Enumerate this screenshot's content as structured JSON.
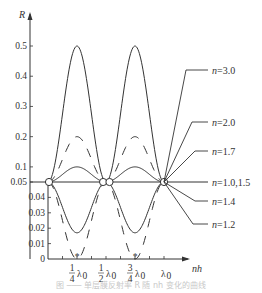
{
  "chart_data": {
    "type": "line",
    "title": "",
    "xlabel": "nh",
    "ylabel": "R",
    "x_unit": "λ0",
    "x_ticks": [
      {
        "value": 0.25,
        "label_num": "1",
        "label_den": "4",
        "label_suffix": "λ0",
        "marker": "*"
      },
      {
        "value": 0.5,
        "label_num": "1",
        "label_den": "2",
        "label_suffix": "λ0"
      },
      {
        "value": 0.75,
        "label_num": "3",
        "label_den": "4",
        "label_suffix": "λ0",
        "marker": "*"
      },
      {
        "value": 1.0,
        "label": "λ0"
      }
    ],
    "x_minor_ticks": [
      0.125,
      0.25,
      0.375,
      0.5,
      0.625,
      0.75,
      0.875,
      1.0
    ],
    "y_axis_break": 0.05,
    "y_ticks_upper": [
      "0.5",
      "0.4",
      "0.3",
      "0.2",
      "0.1",
      "0.05"
    ],
    "y_ticks_lower": [
      "0.04",
      "0.03",
      "0.02",
      "0.01",
      "0"
    ],
    "ylim": [
      0,
      0.55
    ],
    "xlim": [
      0,
      1.1
    ],
    "grid": false,
    "legend_position": "right, leader-line labels",
    "series": [
      {
        "name": "n=3.0",
        "style": "solid",
        "peak_R": 0.5,
        "x": [
          0,
          0.125,
          0.25,
          0.375,
          0.5,
          0.625,
          0.75,
          0.875,
          1.0
        ],
        "values": [
          0.05,
          0.275,
          0.5,
          0.275,
          0.05,
          0.275,
          0.5,
          0.275,
          0.05
        ]
      },
      {
        "name": "n=2.0",
        "style": "dashed",
        "peak_R": 0.2,
        "x": [
          0,
          0.125,
          0.25,
          0.375,
          0.5,
          0.625,
          0.75,
          0.875,
          1.0
        ],
        "values": [
          0.05,
          0.125,
          0.2,
          0.125,
          0.05,
          0.125,
          0.2,
          0.125,
          0.05
        ]
      },
      {
        "name": "n=1.7",
        "style": "solid",
        "peak_R": 0.1,
        "x": [
          0,
          0.125,
          0.25,
          0.375,
          0.5,
          0.625,
          0.75,
          0.875,
          1.0
        ],
        "values": [
          0.05,
          0.075,
          0.1,
          0.075,
          0.05,
          0.075,
          0.1,
          0.075,
          0.05
        ]
      },
      {
        "name": "n=1.0,1.5",
        "style": "solid",
        "peak_R": 0.05,
        "x": [
          0,
          1.0
        ],
        "values": [
          0.05,
          0.05
        ]
      },
      {
        "name": "n=1.4",
        "style": "solid",
        "peak_R": 0.017,
        "x": [
          0,
          0.125,
          0.25,
          0.375,
          0.5,
          0.625,
          0.75,
          0.875,
          1.0
        ],
        "values": [
          0.05,
          0.034,
          0.017,
          0.034,
          0.05,
          0.034,
          0.017,
          0.034,
          0.05
        ]
      },
      {
        "name": "n=1.2",
        "style": "dashed",
        "peak_R": 0.0,
        "x": [
          0,
          0.125,
          0.25,
          0.375,
          0.5,
          0.625,
          0.75,
          0.875,
          1.0
        ],
        "values": [
          0.05,
          0.025,
          0.0,
          0.025,
          0.05,
          0.025,
          0.0,
          0.025,
          0.05
        ]
      }
    ],
    "annotations": [
      "open circles mark R=0.05 intersection points at nh=0, λ0/2, λ0"
    ]
  },
  "labels": {
    "y_axis": "R",
    "x_axis": "nh",
    "series": [
      "n=3.0",
      "n=2.0",
      "n=1.7",
      "n=1.0,1.5",
      "n=1.4",
      "n=1.2"
    ],
    "x_tick_lambda": "λ",
    "x_tick_sub": "0"
  },
  "caption": "图 ─── 单层膜反射率 R 随 nh 变化的曲线"
}
